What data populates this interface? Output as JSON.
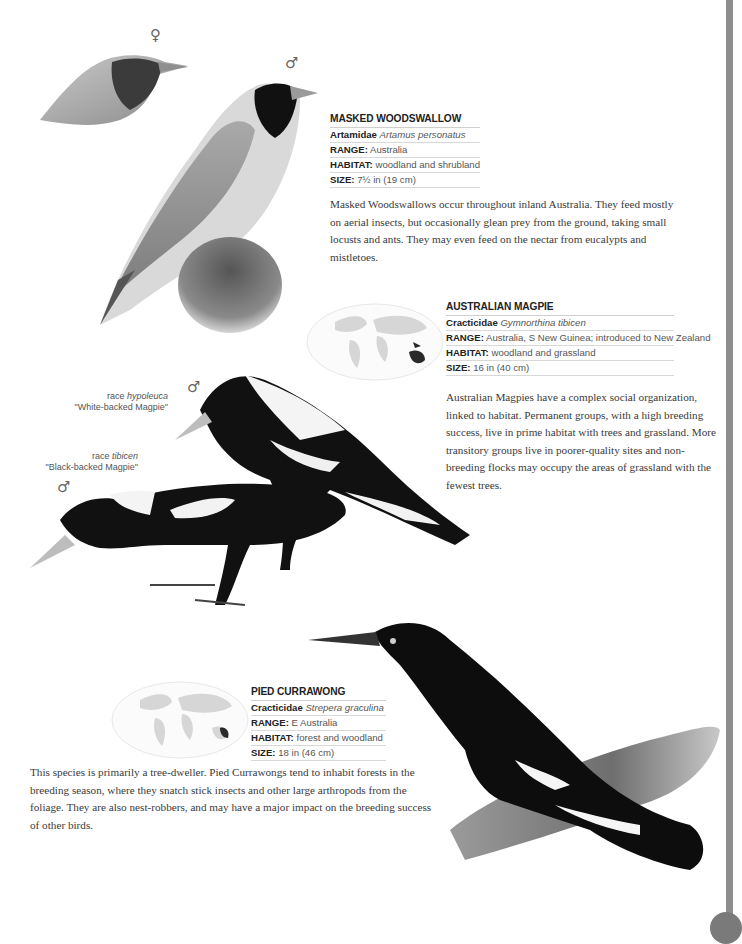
{
  "species": [
    {
      "name": "MASKED WOODSWALLOW",
      "family": "Artamidae",
      "scientific": "Artamus personatus",
      "range_label": "RANGE:",
      "range": "Australia",
      "habitat_label": "HABITAT:",
      "habitat": "woodland and shrubland",
      "size_label": "SIZE:",
      "size": "7½ in (19 cm)",
      "description": "Masked Woodswallows occur throughout inland Australia. They feed mostly on aerial insects, but occasionally glean prey from the ground, taking small locusts and ants. They may even feed on the nectar from eucalypts and mistletoes.",
      "illustration_labels": {
        "female_symbol": "♀",
        "male_symbol": "♂"
      }
    },
    {
      "name": "AUSTRALIAN MAGPIE",
      "family": "Cracticidae",
      "scientific": "Gymnorthina tibicen",
      "range_label": "RANGE:",
      "range": "Australia, S New Guinea; introduced to New Zealand",
      "habitat_label": "HABITAT:",
      "habitat": "woodland and grassland",
      "size_label": "SIZE:",
      "size": "16 in (40 cm)",
      "description": "Australian Magpies have a complex social organization, linked to habitat. Permanent groups, with a high breeding success, live in prime habitat with trees and grassland. More transitory groups live in poorer-quality sites and non-breeding flocks may occupy the areas of grassland with the fewest trees.",
      "races": [
        {
          "race_prefix": "race ",
          "race_name": "hypoleuca",
          "common": "\"White-backed Magpie\"",
          "sex_symbol": "♂"
        },
        {
          "race_prefix": "race ",
          "race_name": "tibicen",
          "common": "\"Black-backed Magpie\"",
          "sex_symbol": "♂"
        }
      ],
      "map": {
        "highlight": "Australia, S New Guinea, New Zealand"
      }
    },
    {
      "name": "PIED CURRAWONG",
      "family": "Cracticidae",
      "scientific": "Strepera graculina",
      "range_label": "RANGE:",
      "range": "E Australia",
      "habitat_label": "HABITAT:",
      "habitat": "forest and woodland",
      "size_label": "SIZE:",
      "size": "18 in (46 cm)",
      "description": "This species is primarily a tree-dweller. Pied Currawongs tend to inhabit forests in the breeding season, where they snatch stick insects and other large arthropods from the foliage. They are also nest-robbers, and may have a major impact on the breeding success of other birds.",
      "map": {
        "highlight": "E Australia"
      }
    }
  ],
  "colors": {
    "page": "#ffffff",
    "edge_strip": "#8e8e8e",
    "text": "#3a3a3a",
    "map_land": "#d6d6d6",
    "map_highlight": "#2a2a2a"
  }
}
